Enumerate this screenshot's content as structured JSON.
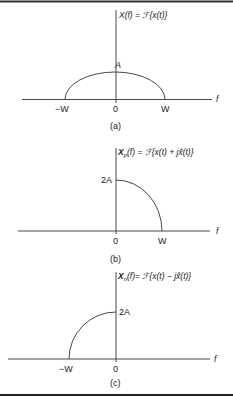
{
  "figure": {
    "panels": [
      {
        "id": "a",
        "caption": "(a)",
        "y_label": "X(f) = ℱ{x(t)}",
        "peak_label": "A",
        "x_axis_label": "f",
        "ticks": [
          "−W",
          "0",
          "W"
        ]
      },
      {
        "id": "b",
        "caption": "(b)",
        "y_label_main": "X",
        "y_label_sub": "p",
        "y_label_rest": "(f) = ℱ{x(t) + jx̂(t)}",
        "peak_label": "2A",
        "x_axis_label": "f",
        "ticks": [
          "0",
          "W"
        ]
      },
      {
        "id": "c",
        "caption": "(c)",
        "y_label_main": "X",
        "y_label_sub": "n",
        "y_label_rest": "(f)= ℱ{x(t) − jx̂(t)}",
        "peak_label": "2A",
        "x_axis_label": "f",
        "ticks": [
          "−W",
          "0"
        ]
      }
    ],
    "colors": {
      "line": "#333333",
      "border": "#222222",
      "background": "#ffffff"
    }
  }
}
